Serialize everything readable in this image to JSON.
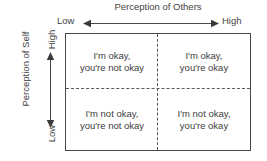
{
  "diagram": {
    "title": "Perception of Others",
    "x_axis": {
      "label": "Perception of Others",
      "low_label": "Low",
      "high_label": "High",
      "arrow": "double-headed-horizontal-arrow"
    },
    "y_axis": {
      "label_line1": "Perception",
      "label_line2": "of Self",
      "high_label": "High",
      "low_label": "Low",
      "arrow": "double-headed-vertical-arrow"
    },
    "quadrants": [
      {
        "position": "top-left",
        "self": "High",
        "others": "Low",
        "line1": "I'm okay,",
        "line2": "you're not okay"
      },
      {
        "position": "top-right",
        "self": "High",
        "others": "High",
        "line1": "I'm okay,",
        "line2": "you're okay"
      },
      {
        "position": "bottom-left",
        "self": "Low",
        "others": "Low",
        "line1": "I'm not okay,",
        "line2": "you're not okay"
      },
      {
        "position": "bottom-right",
        "self": "Low",
        "others": "High",
        "line1": "I'm not okay,",
        "line2": "you're okay"
      }
    ],
    "colors": {
      "background": "#ffffff",
      "border": "#4a4a4a",
      "divider": "#5a5a5a",
      "text": "#3d3d3d",
      "label_text": "#444444"
    }
  }
}
